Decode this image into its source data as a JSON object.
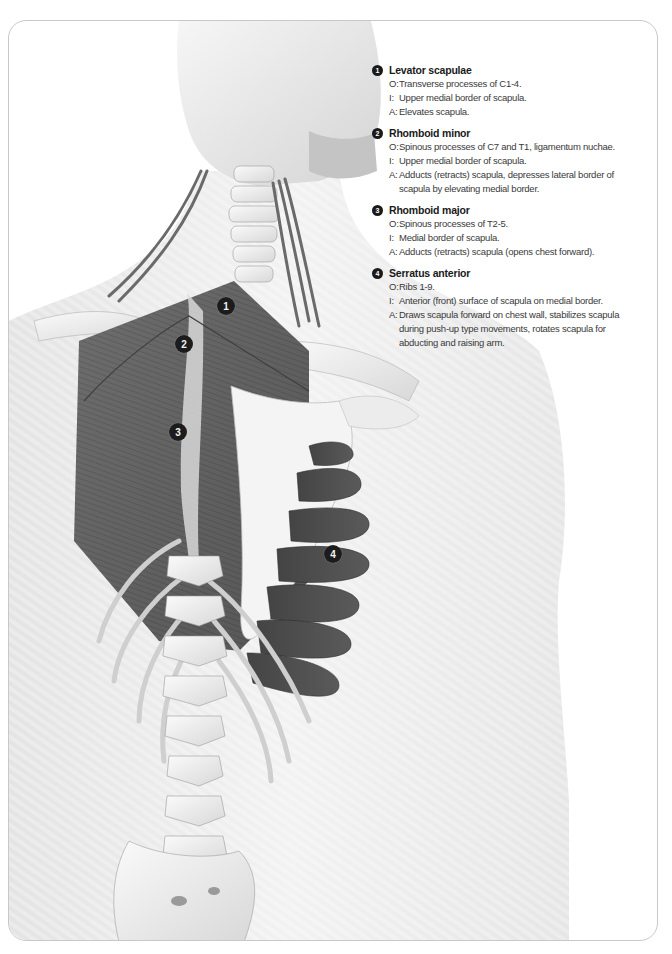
{
  "legend": {
    "entries": [
      {
        "number": "1",
        "title": "Levator scapulae",
        "lines": [
          {
            "key": "O:",
            "text": "Transverse processes of C1-4."
          },
          {
            "key": "I:",
            "text": "Upper medial border of scapula."
          },
          {
            "key": "A:",
            "text": "Elevates scapula."
          }
        ]
      },
      {
        "number": "2",
        "title": "Rhomboid minor",
        "lines": [
          {
            "key": "O:",
            "text": "Spinous processes of C7 and T1, ligamentum nuchae."
          },
          {
            "key": "I:",
            "text": "Upper medial border of scapula."
          },
          {
            "key": "A:",
            "text": "Adducts (retracts) scapula, depresses lateral border of scapula by elevating medial border."
          }
        ]
      },
      {
        "number": "3",
        "title": "Rhomboid major",
        "lines": [
          {
            "key": "O:",
            "text": "Spinous processes of T2-5."
          },
          {
            "key": "I:",
            "text": "Medial border of scapula."
          },
          {
            "key": "A:",
            "text": "Adducts (retracts) scapula (opens chest forward)."
          }
        ]
      },
      {
        "number": "4",
        "title": "Serratus anterior",
        "lines": [
          {
            "key": "O:",
            "text": "Ribs 1-9."
          },
          {
            "key": "I:",
            "text": "Anterior (front) surface of scapula on medial border."
          },
          {
            "key": "A:",
            "text": "Draws scapula forward on chest wall, stabilizes scapula during push-up type movements, rotates scapula for abducting and raising arm."
          }
        ]
      }
    ]
  },
  "illustration": {
    "description": "Posterior view of upper back showing scapular muscles",
    "markers": [
      {
        "number": "1",
        "x": 216,
        "y": 284
      },
      {
        "number": "2",
        "x": 174,
        "y": 322
      },
      {
        "number": "3",
        "x": 168,
        "y": 410
      },
      {
        "number": "4",
        "x": 323,
        "y": 532
      }
    ]
  }
}
